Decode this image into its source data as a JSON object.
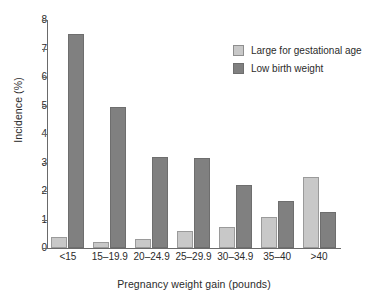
{
  "chart_data": {
    "type": "bar",
    "title": "",
    "xlabel": "Pregnancy weight gain (pounds)",
    "ylabel": "Incidence (%)",
    "categories": [
      "<15",
      "15–19.9",
      "20–24.9",
      "25–29.9",
      "30–34.9",
      "35–40",
      ">40"
    ],
    "series": [
      {
        "name": "Large for gestational age",
        "color": "#c8c8c8",
        "values": [
          0.4,
          0.2,
          0.3,
          0.6,
          0.75,
          1.1,
          2.5
        ]
      },
      {
        "name": "Low birth weight",
        "color": "#808080",
        "values": [
          7.5,
          4.95,
          3.2,
          3.15,
          2.2,
          1.65,
          1.25
        ]
      }
    ],
    "ylim": [
      0,
      8
    ],
    "yticks": [
      "0",
      "1",
      "2",
      "3",
      "4",
      "5",
      "6",
      "7",
      "8"
    ],
    "grid": false,
    "legend_position": "top-right"
  },
  "legend": {
    "entries": [
      {
        "label": "Large for gestational age"
      },
      {
        "label": "Low birth weight"
      }
    ]
  }
}
